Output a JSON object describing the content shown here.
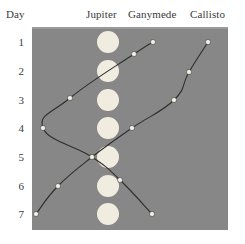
{
  "headers": {
    "day": "Day",
    "jupiter": "Jupiter",
    "ganymede": "Ganymede",
    "callisto": "Callisto"
  },
  "colors": {
    "plot_background": "#878787",
    "jupiter_disk": "#f0ece0",
    "marker_fill": "#f5f2e8",
    "line": "#2e2e2e",
    "text": "#3a3a3a",
    "page_background": "#ffffff"
  },
  "chart_data": {
    "type": "line",
    "title": "",
    "subtitle": "",
    "xlabel": "",
    "ylabel": "Day",
    "x": [
      1,
      2,
      3,
      4,
      5,
      6,
      7
    ],
    "categories": [
      "1",
      "2",
      "3",
      "4",
      "5",
      "6",
      "7"
    ],
    "tick_labels": [
      "1",
      "2",
      "3",
      "4",
      "5",
      "6",
      "7"
    ],
    "ylim": [
      1,
      7
    ],
    "xlim": [
      -3.6,
      3.6
    ],
    "grid": false,
    "legend": "column-headers-top",
    "axis_note": "Vertical axis is Day (1 at top, 7 at bottom). Horizontal axis is apparent angular offset from Jupiter in arbitrary units; Jupiter sits at offset 0.",
    "series": [
      {
        "name": "Jupiter",
        "marker": "large-disk",
        "line": false,
        "values": [
          0,
          0,
          0,
          0,
          0,
          0,
          0
        ],
        "points_px": [
          {
            "day": 1,
            "x": 108,
            "y": 42
          },
          {
            "day": 2,
            "x": 108,
            "y": 71
          },
          {
            "day": 3,
            "x": 108,
            "y": 100
          },
          {
            "day": 4,
            "x": 108,
            "y": 128
          },
          {
            "day": 5,
            "x": 108,
            "y": 157
          },
          {
            "day": 6,
            "x": 108,
            "y": 186
          },
          {
            "day": 7,
            "x": 108,
            "y": 214
          }
        ]
      },
      {
        "name": "Ganymede",
        "marker": "small-dot",
        "line": true,
        "values": [
          2.4,
          1.3,
          -1.7,
          -3.2,
          -0.9,
          1.4,
          2.3
        ],
        "points_px": [
          {
            "day": 1,
            "x": 153,
            "y": 42
          },
          {
            "day": 2,
            "x": 134,
            "y": 54
          },
          {
            "day": 3,
            "x": 70,
            "y": 98
          },
          {
            "day": 4,
            "x": 43,
            "y": 128
          },
          {
            "day": 5,
            "x": 92,
            "y": 157
          },
          {
            "day": 6,
            "x": 120,
            "y": 180
          },
          {
            "day": 7,
            "x": 152,
            "y": 214
          }
        ]
      },
      {
        "name": "Callisto",
        "marker": "small-dot",
        "line": true,
        "values": [
          3.5,
          2.8,
          2.2,
          0.9,
          -0.6,
          -1.8,
          -2.6
        ],
        "points_px": [
          {
            "day": 1,
            "x": 208,
            "y": 42
          },
          {
            "day": 2,
            "x": 189,
            "y": 72
          },
          {
            "day": 3,
            "x": 174,
            "y": 100
          },
          {
            "day": 4,
            "x": 132,
            "y": 128
          },
          {
            "day": 5,
            "x": 92,
            "y": 157
          },
          {
            "day": 6,
            "x": 58,
            "y": 186
          },
          {
            "day": 7,
            "x": 36,
            "y": 214
          }
        ]
      }
    ]
  }
}
